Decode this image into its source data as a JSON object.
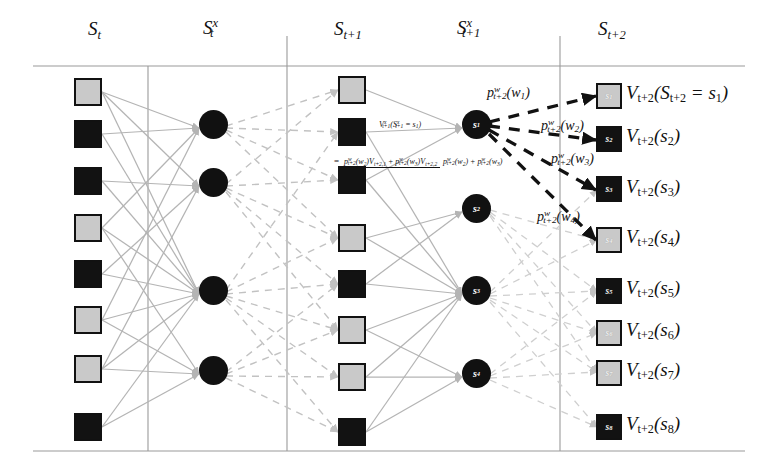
{
  "figure": {
    "columns": [
      {
        "id": "st",
        "label_main": "S",
        "label_sub": "t",
        "label_sup": "",
        "x": 92,
        "header_x": 88,
        "header_y": 24
      },
      {
        "id": "stx",
        "label_main": "S",
        "label_sub": "t",
        "label_sup": "x",
        "x": 212,
        "header_x": 203,
        "header_y": 22
      },
      {
        "id": "st1",
        "label_main": "S",
        "label_sub": "t+1",
        "label_sup": "",
        "x": 352,
        "header_x": 334,
        "header_y": 24
      },
      {
        "id": "st1x",
        "label_main": "S",
        "label_sub": "t+1",
        "label_sup": "x",
        "x": 477,
        "header_x": 459,
        "header_y": 22
      },
      {
        "id": "st2",
        "label_main": "S",
        "label_sub": "t+2",
        "label_sup": "",
        "x": 620,
        "header_x": 600,
        "header_y": 24
      }
    ],
    "rules": {
      "top_h_line": {
        "x1": 33,
        "x2": 745,
        "y": 66
      },
      "bottom_h_line": {
        "x1": 33,
        "x2": 745,
        "y": 451
      },
      "v_lines": [
        {
          "x": 148,
          "y1": 66,
          "y2": 451
        },
        {
          "x": 287,
          "y1": 36,
          "y2": 451
        },
        {
          "x": 560,
          "y1": 36,
          "y2": 451
        }
      ]
    },
    "colors": {
      "light_state": "#c9c9c9",
      "dark_state": "#121212",
      "node_fill": "#111111",
      "solid_edge": "#b4b4b4",
      "dashed_edge": "#bdbdbd",
      "highlight_edge": "#111111",
      "rule_line": "#9a9a9a"
    },
    "column_st": {
      "name": "S_t",
      "squares": [
        {
          "shade": "light",
          "y": 78
        },
        {
          "shade": "dark",
          "y": 120
        },
        {
          "shade": "dark",
          "y": 167
        },
        {
          "shade": "light",
          "y": 214
        },
        {
          "shade": "dark",
          "y": 260
        },
        {
          "shade": "light",
          "y": 306
        },
        {
          "shade": "light",
          "y": 356
        },
        {
          "shade": "dark",
          "y": 414
        }
      ]
    },
    "column_stx": {
      "name": "S_t^x",
      "nodes": [
        {
          "y": 124
        },
        {
          "y": 181
        },
        {
          "y": 290
        },
        {
          "y": 370
        }
      ]
    },
    "column_st1": {
      "name": "S_{t+1}",
      "squares": [
        {
          "shade": "light",
          "y": 78
        },
        {
          "shade": "dark",
          "y": 120
        },
        {
          "shade": "dark",
          "y": 167
        },
        {
          "shade": "light",
          "y": 226
        },
        {
          "shade": "dark",
          "y": 272
        },
        {
          "shade": "light",
          "y": 318
        },
        {
          "shade": "light",
          "y": 365
        },
        {
          "shade": "dark",
          "y": 420
        }
      ]
    },
    "column_st1x": {
      "name": "S_{t+1}^x",
      "nodes": [
        {
          "label": "s",
          "sub": "1",
          "y": 124
        },
        {
          "label": "s",
          "sub": "2",
          "y": 208
        },
        {
          "label": "s",
          "sub": "3",
          "y": 290
        },
        {
          "label": "s",
          "sub": "4",
          "y": 373
        }
      ]
    },
    "column_st2": {
      "name": "S_{t+2}",
      "states": [
        {
          "shade": "light",
          "tag": "s",
          "tag_sub": "1",
          "y": 88,
          "value_text": "V",
          "value_sub": "t+2",
          "arg": "(S",
          "arg_sub": "t+2",
          "arg_tail": " = s",
          "arg_tail_sub": "1",
          "arg_close": ")"
        },
        {
          "shade": "dark",
          "tag": "s",
          "tag_sub": "2",
          "y": 131,
          "value_text": "V",
          "value_sub": "t+2",
          "arg": "(s",
          "arg_sub": "2",
          "arg_close": ")"
        },
        {
          "shade": "dark",
          "tag": "s",
          "tag_sub": "3",
          "y": 182,
          "value_text": "V",
          "value_sub": "t+2",
          "arg": "(s",
          "arg_sub": "3",
          "arg_close": ")"
        },
        {
          "shade": "light",
          "tag": "s",
          "tag_sub": "4",
          "y": 232,
          "value_text": "V",
          "value_sub": "t+2",
          "arg": "(s",
          "arg_sub": "4",
          "arg_close": ")"
        },
        {
          "shade": "dark",
          "tag": "s",
          "tag_sub": "5",
          "y": 283,
          "value_text": "V",
          "value_sub": "t+2",
          "arg": "(s",
          "arg_sub": "5",
          "arg_close": ")"
        },
        {
          "shade": "light",
          "tag": "s",
          "tag_sub": "6",
          "y": 325,
          "value_text": "V",
          "value_sub": "t+2",
          "arg": "(s",
          "arg_sub": "6",
          "arg_close": ")"
        },
        {
          "shade": "light",
          "tag": "s",
          "tag_sub": "7",
          "y": 365,
          "value_text": "V",
          "value_sub": "t+2",
          "arg": "(s",
          "arg_sub": "7",
          "arg_close": ")"
        },
        {
          "shade": "dark",
          "tag": "s",
          "tag_sub": "8",
          "y": 419,
          "value_text": "V",
          "value_sub": "t+2",
          "arg": "(s",
          "arg_sub": "8",
          "arg_close": ")"
        }
      ]
    },
    "prob_labels": [
      {
        "id": "pw1",
        "p": "p",
        "sup": "w",
        "sub": "t+2",
        "arg": "(w",
        "arg_sub": "1",
        "close": ")",
        "x": 487,
        "y": 86
      },
      {
        "id": "pw2",
        "p": "p",
        "sup": "w",
        "sub": "t+2",
        "arg": "(w",
        "arg_sub": "2",
        "close": ")",
        "x": 541,
        "y": 119
      },
      {
        "id": "pw3",
        "p": "p",
        "sup": "w",
        "sub": "t+2",
        "arg": "(w",
        "arg_sub": "3",
        "close": ")",
        "x": 551,
        "y": 152
      },
      {
        "id": "pw4",
        "p": "p",
        "sup": "w",
        "sub": "t+2",
        "arg": "(w",
        "arg_sub": "4",
        "close": ")",
        "x": 537,
        "y": 210
      }
    ],
    "value_expression": {
      "lhs": {
        "v": "V",
        "sup": "x",
        "sub": "t+1",
        "open": "(S",
        "s_sup": "x",
        "s_sub": "t+1",
        "eq": " = s",
        "eq_sub": "1",
        "close": ")",
        "x": 379,
        "y": 120
      },
      "fraction": {
        "equals": "=",
        "numerator": "p^w_{t+2}(w_2)V_{t+2,1} + p^w_{t+2}(w_3)V_{t+2,2}",
        "denominator": "p^w_{t+2}(w_2) + p^w_{t+2}(w_3)",
        "x": 334,
        "y": 158
      }
    },
    "fraction_tokens": {
      "num": [
        {
          "t": "p",
          "sup": "w",
          "sub": "t+2"
        },
        {
          "t": "(w",
          "sub": "2"
        },
        {
          "t": ")"
        },
        {
          "t": "V",
          "sub": "t+2,1"
        },
        {
          "t": " + "
        },
        {
          "t": "p",
          "sup": "w",
          "sub": "t+2"
        },
        {
          "t": "(w",
          "sub": "3"
        },
        {
          "t": ")"
        },
        {
          "t": "V",
          "sub": "t+2,2"
        }
      ],
      "den": [
        {
          "t": "p",
          "sup": "w",
          "sub": "t+2"
        },
        {
          "t": "(w",
          "sub": "2"
        },
        {
          "t": ")"
        },
        {
          "t": " + "
        },
        {
          "t": "p",
          "sup": "w",
          "sub": "t+2"
        },
        {
          "t": "(w",
          "sub": "3"
        },
        {
          "t": ")"
        }
      ]
    }
  }
}
